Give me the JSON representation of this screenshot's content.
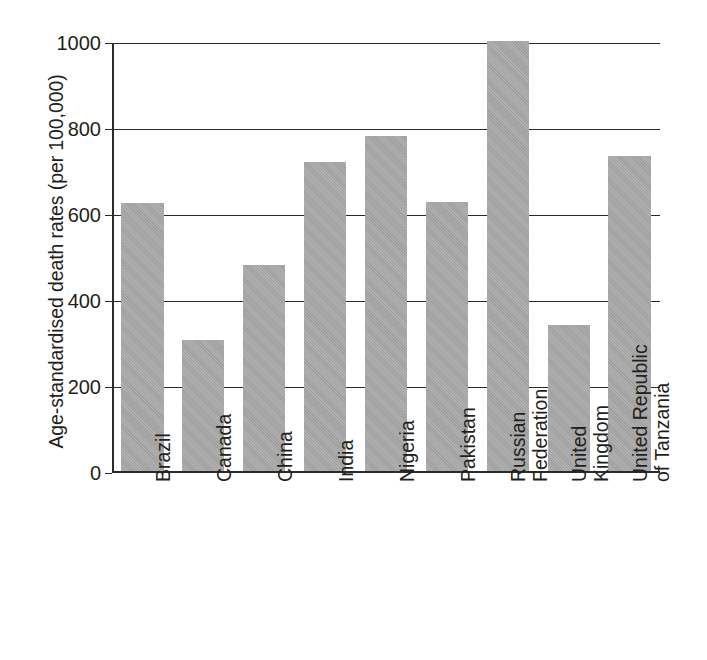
{
  "chart_data": {
    "type": "bar",
    "title": "",
    "subtitle": "",
    "xlabel": "",
    "ylabel": "Age-standardised death rates (per 100,000)",
    "ylim": [
      0,
      1000
    ],
    "ytick_values": [
      0,
      200,
      400,
      600,
      800,
      1000
    ],
    "ytick_labels": [
      "0",
      "200",
      "400",
      "600",
      "800",
      "1000"
    ],
    "grid": true,
    "legend": null,
    "bar_color": "#a8a8a8",
    "axis_color": "#2b2b2b",
    "categories": [
      "Brazil",
      "Canada",
      "China",
      "India",
      "Nigeria",
      "Pakistan",
      "Russian Federation",
      "United Kingdom",
      "United Republic of Tanzania"
    ],
    "category_label_lines": [
      [
        "Brazil"
      ],
      [
        "Canada"
      ],
      [
        "China"
      ],
      [
        "India"
      ],
      [
        "Nigeria"
      ],
      [
        "Pakistan"
      ],
      [
        "Russian",
        "Federation"
      ],
      [
        "United",
        "Kingdom"
      ],
      [
        "United Republic",
        "of Tanzania"
      ]
    ],
    "values": [
      625,
      305,
      480,
      720,
      780,
      627,
      1000,
      340,
      733
    ]
  },
  "axis": {
    "y_title": "Age-standardised death rates (per 100,000)"
  }
}
